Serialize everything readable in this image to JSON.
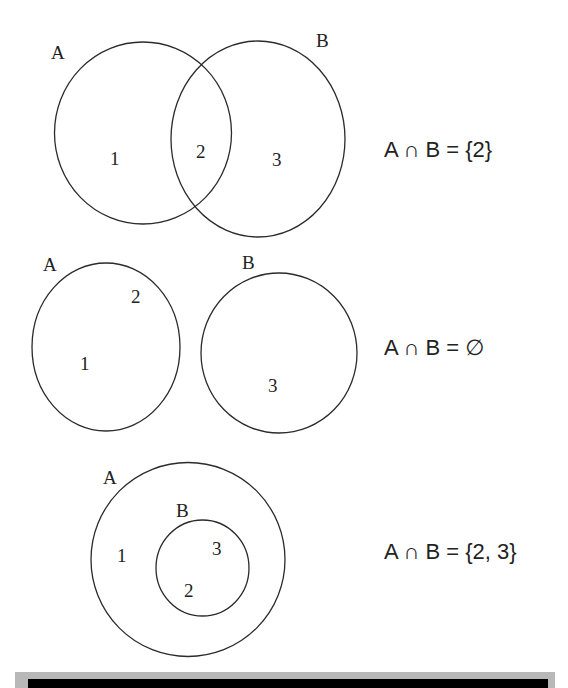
{
  "colors": {
    "background": "#ffffff",
    "stroke": "#2b2b2b",
    "text": "#222222",
    "footer_band": "#b8b8b8",
    "footer_bar": "#000000"
  },
  "diagrams": [
    {
      "id": "overlap",
      "sets": [
        {
          "label": "A",
          "elements": [
            "1",
            "2"
          ]
        },
        {
          "label": "B",
          "elements": [
            "2",
            "3"
          ]
        }
      ],
      "regions": {
        "a_only": "1",
        "intersection": "2",
        "b_only": "3"
      },
      "equation": "A ∩ B = {2}"
    },
    {
      "id": "disjoint",
      "sets": [
        {
          "label": "A",
          "elements": [
            "1",
            "2"
          ]
        },
        {
          "label": "B",
          "elements": [
            "3"
          ]
        }
      ],
      "regions": {
        "a_element_1": "1",
        "a_element_2": "2",
        "b_element_1": "3"
      },
      "equation": "A ∩ B = ∅"
    },
    {
      "id": "subset",
      "sets": [
        {
          "label": "A",
          "elements": [
            "1",
            "2",
            "3"
          ]
        },
        {
          "label": "B",
          "elements": [
            "2",
            "3"
          ]
        }
      ],
      "regions": {
        "a_only": "1",
        "b_element_1": "3",
        "b_element_2": "2"
      },
      "equation": "A ∩ B = {2, 3}"
    }
  ]
}
